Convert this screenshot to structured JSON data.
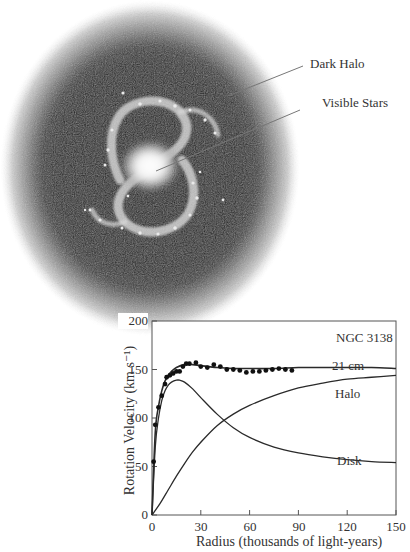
{
  "illustration": {
    "labels": {
      "dark_halo": "Dark Halo",
      "visible_stars": "Visible Stars"
    }
  },
  "chart_data": {
    "type": "line",
    "title": "NGC 3138",
    "xlabel": "Radius (thousands of light-years)",
    "ylabel": "Rotation Velocity (km s⁻¹)",
    "xlim": [
      0,
      150
    ],
    "ylim": [
      0,
      200
    ],
    "xticks": [
      0,
      30,
      60,
      90,
      120,
      150
    ],
    "yticks": [
      0,
      50,
      100,
      150,
      200
    ],
    "grid": false,
    "legend": "inline labels",
    "series": [
      {
        "name": "21 cm",
        "kind": "scatter",
        "x": [
          1,
          2,
          4,
          6,
          8,
          9,
          11,
          13,
          15,
          17,
          19,
          21,
          23,
          27,
          30,
          34,
          38,
          42,
          46,
          50,
          54,
          58,
          62,
          66,
          70,
          74,
          78,
          82,
          86
        ],
        "y": [
          55,
          93,
          111,
          123,
          135,
          142,
          144,
          146,
          148,
          148,
          153,
          156,
          156,
          157,
          153,
          152,
          155,
          153,
          150,
          150,
          149,
          147,
          148,
          148,
          149,
          150,
          151,
          150,
          149
        ]
      },
      {
        "name": "Total fit",
        "kind": "line",
        "x": [
          0,
          2,
          4,
          6,
          8,
          10,
          12,
          15,
          20,
          25,
          30,
          40,
          50,
          60,
          75,
          90,
          105,
          120,
          135,
          150
        ],
        "y": [
          0,
          85,
          112,
          128,
          138,
          144,
          148,
          152,
          155,
          155,
          154,
          152,
          151,
          151,
          151,
          152,
          152,
          152,
          152,
          151
        ]
      },
      {
        "name": "Halo",
        "kind": "line",
        "x": [
          0,
          5,
          10,
          15,
          20,
          25,
          30,
          40,
          50,
          60,
          75,
          90,
          105,
          120,
          135,
          150
        ],
        "y": [
          0,
          12,
          26,
          40,
          53,
          65,
          75,
          92,
          104,
          113,
          123,
          131,
          136,
          140,
          142,
          144
        ]
      },
      {
        "name": "Disk",
        "kind": "line",
        "x": [
          0,
          2,
          4,
          6,
          8,
          10,
          12,
          15,
          17,
          20,
          25,
          30,
          40,
          50,
          60,
          75,
          90,
          105,
          120,
          135,
          150
        ],
        "y": [
          0,
          70,
          100,
          118,
          128,
          134,
          137,
          139,
          139,
          137,
          130,
          121,
          104,
          90,
          80,
          70,
          64,
          60,
          57,
          55,
          54
        ]
      }
    ],
    "annotations": [
      {
        "text": "NGC 3138",
        "x": 118,
        "y": 186
      },
      {
        "text": "21 cm",
        "x": 118,
        "y": 156
      },
      {
        "text": "Halo",
        "x": 118,
        "y": 128
      },
      {
        "text": "Disk",
        "x": 118,
        "y": 58
      }
    ]
  }
}
